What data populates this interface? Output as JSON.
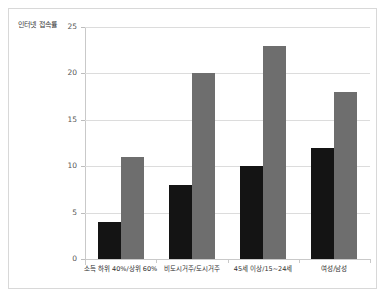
{
  "chart_data": {
    "type": "bar",
    "title": "",
    "subtitle": "",
    "ylabel": "인터넷 접속률",
    "xlabel": "",
    "categories": [
      "소득 하위 40%/상위 60%",
      "비도시거주/도시거주",
      "45세 이상/15~24세",
      "여성/남성"
    ],
    "series": [
      {
        "name": "첫번째 집단",
        "color": "#141414",
        "values": [
          4,
          8,
          10,
          12
        ]
      },
      {
        "name": "두번째 집단",
        "color": "#6e6e6e",
        "values": [
          11,
          20,
          23,
          18
        ]
      }
    ],
    "ylim": [
      0,
      25
    ],
    "yticks": [
      0,
      5,
      10,
      15,
      20,
      25
    ],
    "ytick_labels": [
      "0",
      "5",
      "10",
      "15",
      "20",
      "25"
    ],
    "grid": true,
    "legend": false,
    "legend_position": "none"
  },
  "figure": {
    "background_color": "#ffffff",
    "frame_color": "#d8d8d8",
    "grid_color": "#dcdcdc",
    "axis_color": "#c9c9c9"
  }
}
